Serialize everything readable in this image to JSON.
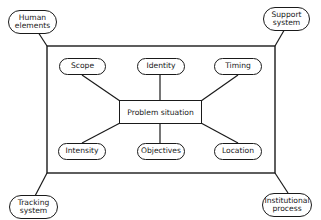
{
  "diagram": {
    "center": {
      "label": "Problem situation"
    },
    "inner_nodes": [
      {
        "id": "scope",
        "label": "Scope"
      },
      {
        "id": "identity",
        "label": "Identity"
      },
      {
        "id": "timing",
        "label": "Timing"
      },
      {
        "id": "intensity",
        "label": "Intensity"
      },
      {
        "id": "objectives",
        "label": "Objectives"
      },
      {
        "id": "location",
        "label": "Location"
      }
    ],
    "corner_nodes": [
      {
        "id": "human",
        "line1": "Human",
        "line2": "elements"
      },
      {
        "id": "support",
        "line1": "Support",
        "line2": "system"
      },
      {
        "id": "tracking",
        "line1": "Tracking",
        "line2": "system"
      },
      {
        "id": "institutional",
        "line1": "Institutional",
        "line2": "process"
      }
    ]
  }
}
